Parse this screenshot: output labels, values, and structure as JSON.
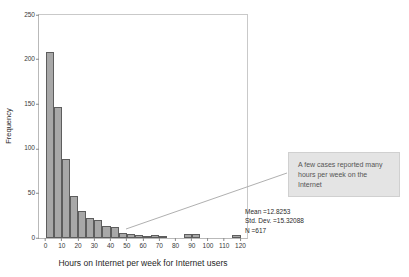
{
  "chart_data": {
    "type": "bar",
    "title": "",
    "xlabel": "Hours on Internet per week for Internet users",
    "ylabel": "Frequency",
    "xlim": [
      -4,
      124
    ],
    "ylim": [
      0,
      250
    ],
    "grid": false,
    "legend": "none",
    "bin_width": 5,
    "xticks": [
      "0",
      "10",
      "20",
      "30",
      "40",
      "50",
      "60",
      "70",
      "80",
      "90",
      "100",
      "110",
      "120"
    ],
    "xtick_values": [
      0,
      10,
      20,
      30,
      40,
      50,
      60,
      70,
      80,
      90,
      100,
      110,
      120
    ],
    "yticks": [
      "0",
      "50",
      "100",
      "150",
      "200",
      "250"
    ],
    "ytick_values": [
      0,
      50,
      100,
      150,
      200,
      250
    ],
    "bin_centers": [
      2.5,
      7.5,
      12.5,
      17.5,
      22.5,
      27.5,
      32.5,
      37.5,
      42.5,
      47.5,
      52.5,
      57.5,
      62.5,
      67.5,
      72.5,
      77.5,
      82.5,
      87.5,
      92.5,
      97.5,
      102.5,
      107.5,
      112.5,
      117.5
    ],
    "categories": [
      "0-5",
      "5-10",
      "10-15",
      "15-20",
      "20-25",
      "25-30",
      "30-35",
      "35-40",
      "40-45",
      "45-50",
      "50-55",
      "55-60",
      "60-65",
      "65-70",
      "70-75",
      "75-80",
      "80-85",
      "85-90",
      "90-95",
      "95-100",
      "100-105",
      "105-110",
      "110-115",
      "115-120"
    ],
    "values": [
      208,
      147,
      89,
      47,
      30,
      22,
      20,
      14,
      12,
      6,
      4,
      3,
      2,
      3,
      1,
      0,
      0,
      5,
      4,
      0,
      0,
      0,
      0,
      3
    ]
  },
  "statistics": {
    "mean_label": "Mean =12.8253",
    "stddev_label": "Std. Dev. =15.32088",
    "n_label": "N =617"
  },
  "annotation": {
    "text": "A few cases reported many hours per week on the Internet"
  },
  "colors": {
    "bar_fill": "#a8a8a8",
    "bar_stroke": "#5d5d5d",
    "callout_bg": "#e4e4e4",
    "frame": "#b9b9b9"
  }
}
